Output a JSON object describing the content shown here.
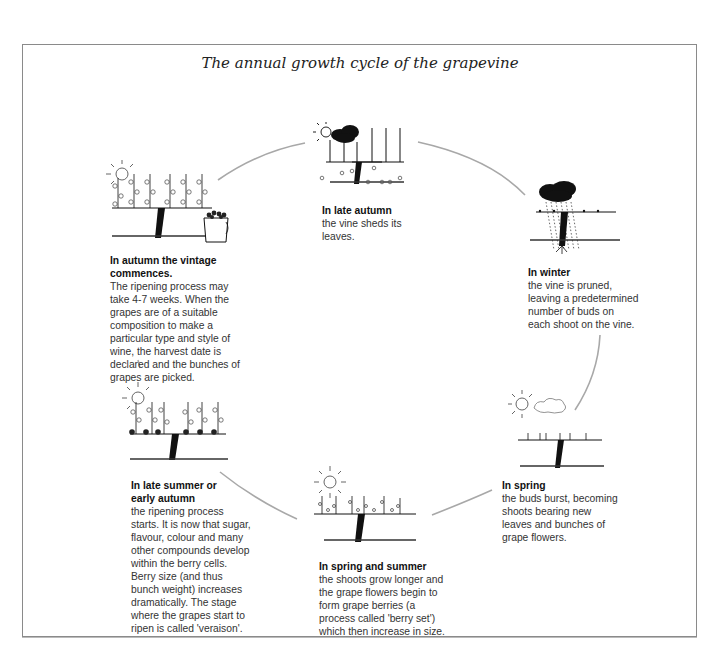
{
  "title": "The annual growth cycle of the grapevine",
  "colors": {
    "frame": "#8a8a8a",
    "arc": "#a8a8a8",
    "ink": "#111111",
    "text": "#333333"
  },
  "stages": [
    {
      "id": "late-autumn",
      "heading": "In late autumn",
      "body": "the vine sheds its\nleaves.",
      "icons": [
        "sun-icon",
        "cloud-icon",
        "bare-vine-icon",
        "fallen-leaves-icon"
      ]
    },
    {
      "id": "winter",
      "heading": "In winter",
      "body": "the vine is pruned,\nleaving a predetermined\nnumber of buds on\neach shoot on the vine.",
      "icons": [
        "rain-cloud-icon",
        "pruned-vine-icon"
      ]
    },
    {
      "id": "spring",
      "heading": "In spring",
      "body": "the buds burst, becoming\nshoots bearing new\nleaves and bunches of\ngrape flowers.",
      "icons": [
        "sun-icon",
        "cloud-icon",
        "budding-vine-icon"
      ]
    },
    {
      "id": "spring-summer",
      "heading": "In spring and summer",
      "body": "the shoots grow longer and\nthe grape flowers begin to\nform grape berries (a\nprocess called 'berry set')\nwhich then increase in size.",
      "icons": [
        "sun-icon",
        "flowering-vine-icon"
      ]
    },
    {
      "id": "late-summer",
      "heading": "In late summer or\nearly autumn",
      "body": "the ripening process\nstarts. It is now that sugar,\nflavour, colour and many\nother compounds develop\nwithin the berry cells.\nBerry size (and thus\nbunch weight) increases\ndramatically. The stage\nwhere the grapes start to\nripen is called 'veraison'.",
      "icons": [
        "sun-icon",
        "ripening-vine-icon"
      ]
    },
    {
      "id": "autumn",
      "heading": "In autumn the vintage\ncommences.",
      "body": "The ripening process may\ntake 4-7 weeks. When the\ngrapes are of a suitable\ncomposition to make a\nparticular type and style of\nwine, the harvest date is\ndeclared and the bunches of\ngrapes are picked.",
      "icons": [
        "sun-icon",
        "full-vine-icon",
        "grape-bucket-icon"
      ]
    }
  ]
}
